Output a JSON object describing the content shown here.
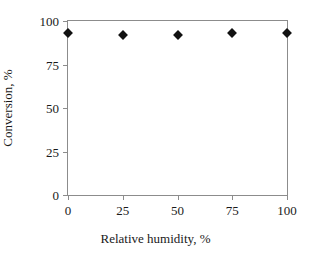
{
  "chart_data": {
    "type": "scatter",
    "title": "",
    "xlabel": "Relative humidity, %",
    "ylabel": "Conversion, %",
    "xlim": [
      0,
      100
    ],
    "ylim": [
      0,
      100
    ],
    "xticks": [
      0,
      25,
      50,
      75,
      100
    ],
    "yticks": [
      0,
      25,
      50,
      75,
      100
    ],
    "xtick_labels": [
      "0",
      "25",
      "50",
      "75",
      "100"
    ],
    "ytick_labels": [
      "0",
      "25",
      "50",
      "75",
      "100"
    ],
    "grid": false,
    "legend": false,
    "marker": "diamond",
    "marker_color": "#111111",
    "frame_color": "#8c8c8c",
    "series": [
      {
        "name": "Conversion",
        "x": [
          0,
          25,
          50,
          75,
          100
        ],
        "values": [
          93,
          92,
          92,
          93,
          93
        ]
      }
    ],
    "points": [
      {
        "x": 0,
        "y": 93
      },
      {
        "x": 25,
        "y": 92
      },
      {
        "x": 50,
        "y": 92
      },
      {
        "x": 75,
        "y": 93
      },
      {
        "x": 100,
        "y": 93
      }
    ]
  }
}
